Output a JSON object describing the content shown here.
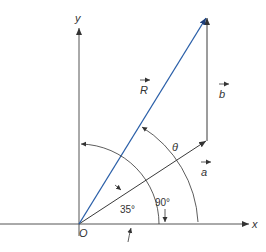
{
  "diagram": {
    "type": "vector-addition",
    "axes": {
      "x_label": "x",
      "y_label": "y",
      "origin_label": "O"
    },
    "vectors": [
      {
        "name": "a",
        "label": "a",
        "color": "#3a3a3a"
      },
      {
        "name": "b",
        "label": "b",
        "color": "#3a3a3a"
      },
      {
        "name": "R",
        "label": "R",
        "color": "#2a5fa8"
      }
    ],
    "angles": [
      {
        "label": "35°",
        "description": "angle of a from x-axis"
      },
      {
        "label": "90°",
        "description": "angle of y-axis from x-axis"
      },
      {
        "label": "θ",
        "description": "angle between a and R"
      }
    ],
    "colors": {
      "line": "#3a3a3a",
      "resultant": "#2a5fa8",
      "background": "#ffffff"
    }
  }
}
